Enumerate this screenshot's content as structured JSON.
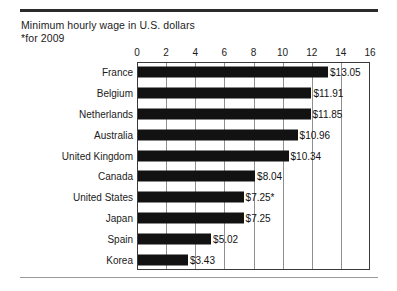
{
  "title": {
    "line1": "Minimum hourly wage in U.S. dollars",
    "line2": "*for 2009"
  },
  "chart_data": {
    "type": "bar",
    "orientation": "horizontal",
    "title": "Minimum hourly wage in U.S. dollars",
    "subtitle": "*for 2009",
    "xlabel": "",
    "ylabel": "",
    "xlim": [
      0,
      16
    ],
    "xticks": [
      0,
      2,
      4,
      6,
      8,
      10,
      12,
      14,
      16
    ],
    "grid": true,
    "grid_axis": "x",
    "legend": false,
    "categories": [
      "France",
      "Belgium",
      "Netherlands",
      "Australia",
      "United Kingdom",
      "Canada",
      "United States",
      "Japan",
      "Spain",
      "Korea"
    ],
    "values": [
      13.05,
      11.91,
      11.85,
      10.96,
      10.34,
      8.04,
      7.25,
      7.25,
      5.02,
      3.43
    ],
    "data_labels": [
      "$13.05",
      "$11.91",
      "$11.85",
      "$10.96",
      "$10.34",
      "$8.04",
      "$7.25*",
      "$7.25",
      "$5.02",
      "$3.43"
    ],
    "annotations": [
      "*for 2009 applies to the United States value"
    ],
    "bar_color": "#121212",
    "grid_color": "#8f8f8f",
    "axis_color": "#3a3a3a"
  }
}
